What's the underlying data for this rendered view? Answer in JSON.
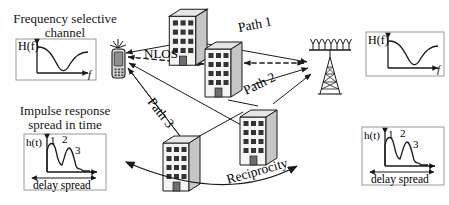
{
  "figure": {
    "domain": "wireless-propagation-diagram",
    "background": "#ffffff",
    "ink": "#1a1a1a"
  },
  "left_panel": {
    "caption_line1": "Frequency selective",
    "caption_line2": "channel",
    "plot": {
      "name": "frequency-response-plot",
      "ylabel": "H(f)",
      "xlabel": "f"
    }
  },
  "left_panel_lower": {
    "caption_line1": "Impulse response",
    "caption_line2": "spread in time",
    "plot": {
      "name": "impulse-response-plot",
      "ylabel": "h(t)",
      "xlabel": "t",
      "peak_labels": [
        "1",
        "2",
        "3"
      ],
      "span_label": "delay spread"
    }
  },
  "right_panel_upper": {
    "plot": {
      "name": "frequency-response-plot",
      "ylabel": "H(f)",
      "xlabel": "f"
    }
  },
  "right_panel_lower": {
    "plot": {
      "name": "impulse-response-plot",
      "ylabel": "h(t)",
      "xlabel": "t",
      "peak_labels": [
        "1",
        "2",
        "3"
      ],
      "span_label": "delay spread"
    }
  },
  "scene": {
    "labels": {
      "nlos": "NLOS",
      "path1": "Path 1",
      "path2": "Path 2",
      "path3": "Path 3",
      "reciprocity": "Reciprocity"
    },
    "nodes": [
      {
        "name": "mobile-handset",
        "type": "handset"
      },
      {
        "name": "base-station",
        "type": "tower-antenna-array"
      },
      {
        "name": "building-top",
        "type": "building"
      },
      {
        "name": "building-middle",
        "type": "building"
      },
      {
        "name": "building-lower-left",
        "type": "building"
      },
      {
        "name": "building-lower-right",
        "type": "building"
      }
    ],
    "colors": {
      "building_face": "#f2f2f2",
      "building_side": "#c9c9c9",
      "building_roof": "#e4e4e4",
      "window": "#3a3a3a",
      "door": "#6a6a6a",
      "stroke": "#1a1a1a"
    }
  }
}
